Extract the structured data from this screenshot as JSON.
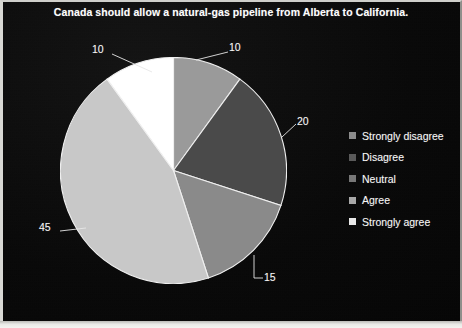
{
  "chart_data": {
    "type": "pie",
    "title": "Canada should allow a natural-gas pipeline from Alberta to California.",
    "categories": [
      "Strongly disagree",
      "Disagree",
      "Neutral",
      "Agree",
      "Strongly agree"
    ],
    "values": [
      10,
      20,
      15,
      45,
      10
    ],
    "value_labels": [
      "10",
      "20",
      "15",
      "45",
      "10"
    ],
    "slice_colors": [
      "#9a9a9a",
      "#4a4a4a",
      "#8a8a8a",
      "#c8c8c8",
      "#ffffff"
    ],
    "legend_swatch_colors": [
      "#8c8c8c",
      "#5a5a5a",
      "#777777",
      "#a8a8a8",
      "#e8e8e8"
    ],
    "legend_position": "right",
    "grid": false,
    "start_angle_deg": 0,
    "direction": "clockwise",
    "labels_outside": true,
    "leader_lines": true,
    "background_color": "#080808",
    "text_color": "#f7f7f7",
    "xlabel": "",
    "ylabel": ""
  },
  "figure": {
    "title": "Canada should allow a natural-gas pipeline from Alberta to California.",
    "labels": {
      "strongly_disagree": "10",
      "disagree": "20",
      "neutral": "15",
      "agree": "45",
      "strongly_agree": "10"
    }
  },
  "legend": {
    "items": [
      {
        "label": "Strongly disagree",
        "color": "#8c8c8c"
      },
      {
        "label": "Disagree",
        "color": "#5a5a5a"
      },
      {
        "label": "Neutral",
        "color": "#777777"
      },
      {
        "label": "Agree",
        "color": "#a8a8a8"
      },
      {
        "label": "Strongly agree",
        "color": "#e8e8e8"
      }
    ]
  }
}
